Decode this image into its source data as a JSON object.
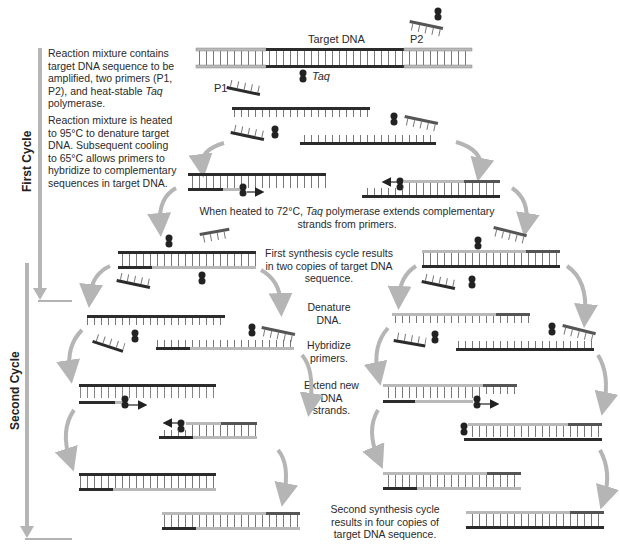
{
  "cycles": {
    "first": "First Cycle",
    "second": "Second Cycle"
  },
  "labels": {
    "target_dna": "Target DNA",
    "p1": "P1",
    "p2": "P2",
    "taq": "Taq"
  },
  "steps": {
    "step1_prefix": "Reaction mixture contains target DNA sequence to be amplified, two primers (P1, P2), and heat-stable ",
    "step1_italic": "Taq",
    "step1_suffix": " polymerase.",
    "step2": "Reaction mixture is heated to 95°C to denature target DNA. Subsequent cooling to 65°C allows primers to hybridize to complementary sequences in target DNA.",
    "step3_prefix": "When heated to 72°C, ",
    "step3_italic": "Taq",
    "step3_suffix": " polymerase extends complementary strands from primers.",
    "step4": "First synthesis cycle results in two copies of target DNA sequence.",
    "step5": "Denature DNA.",
    "step6": "Hybridize primers.",
    "step7": "Extend new DNA strands.",
    "step8": "Second synthesis cycle results in four copies of target DNA sequence."
  },
  "colors": {
    "dark_strand": "#2b2b2b",
    "light_strand": "#b9b9b9",
    "mid_strand": "#5a5a5a",
    "arrow_gray": "#b5b5b5"
  }
}
